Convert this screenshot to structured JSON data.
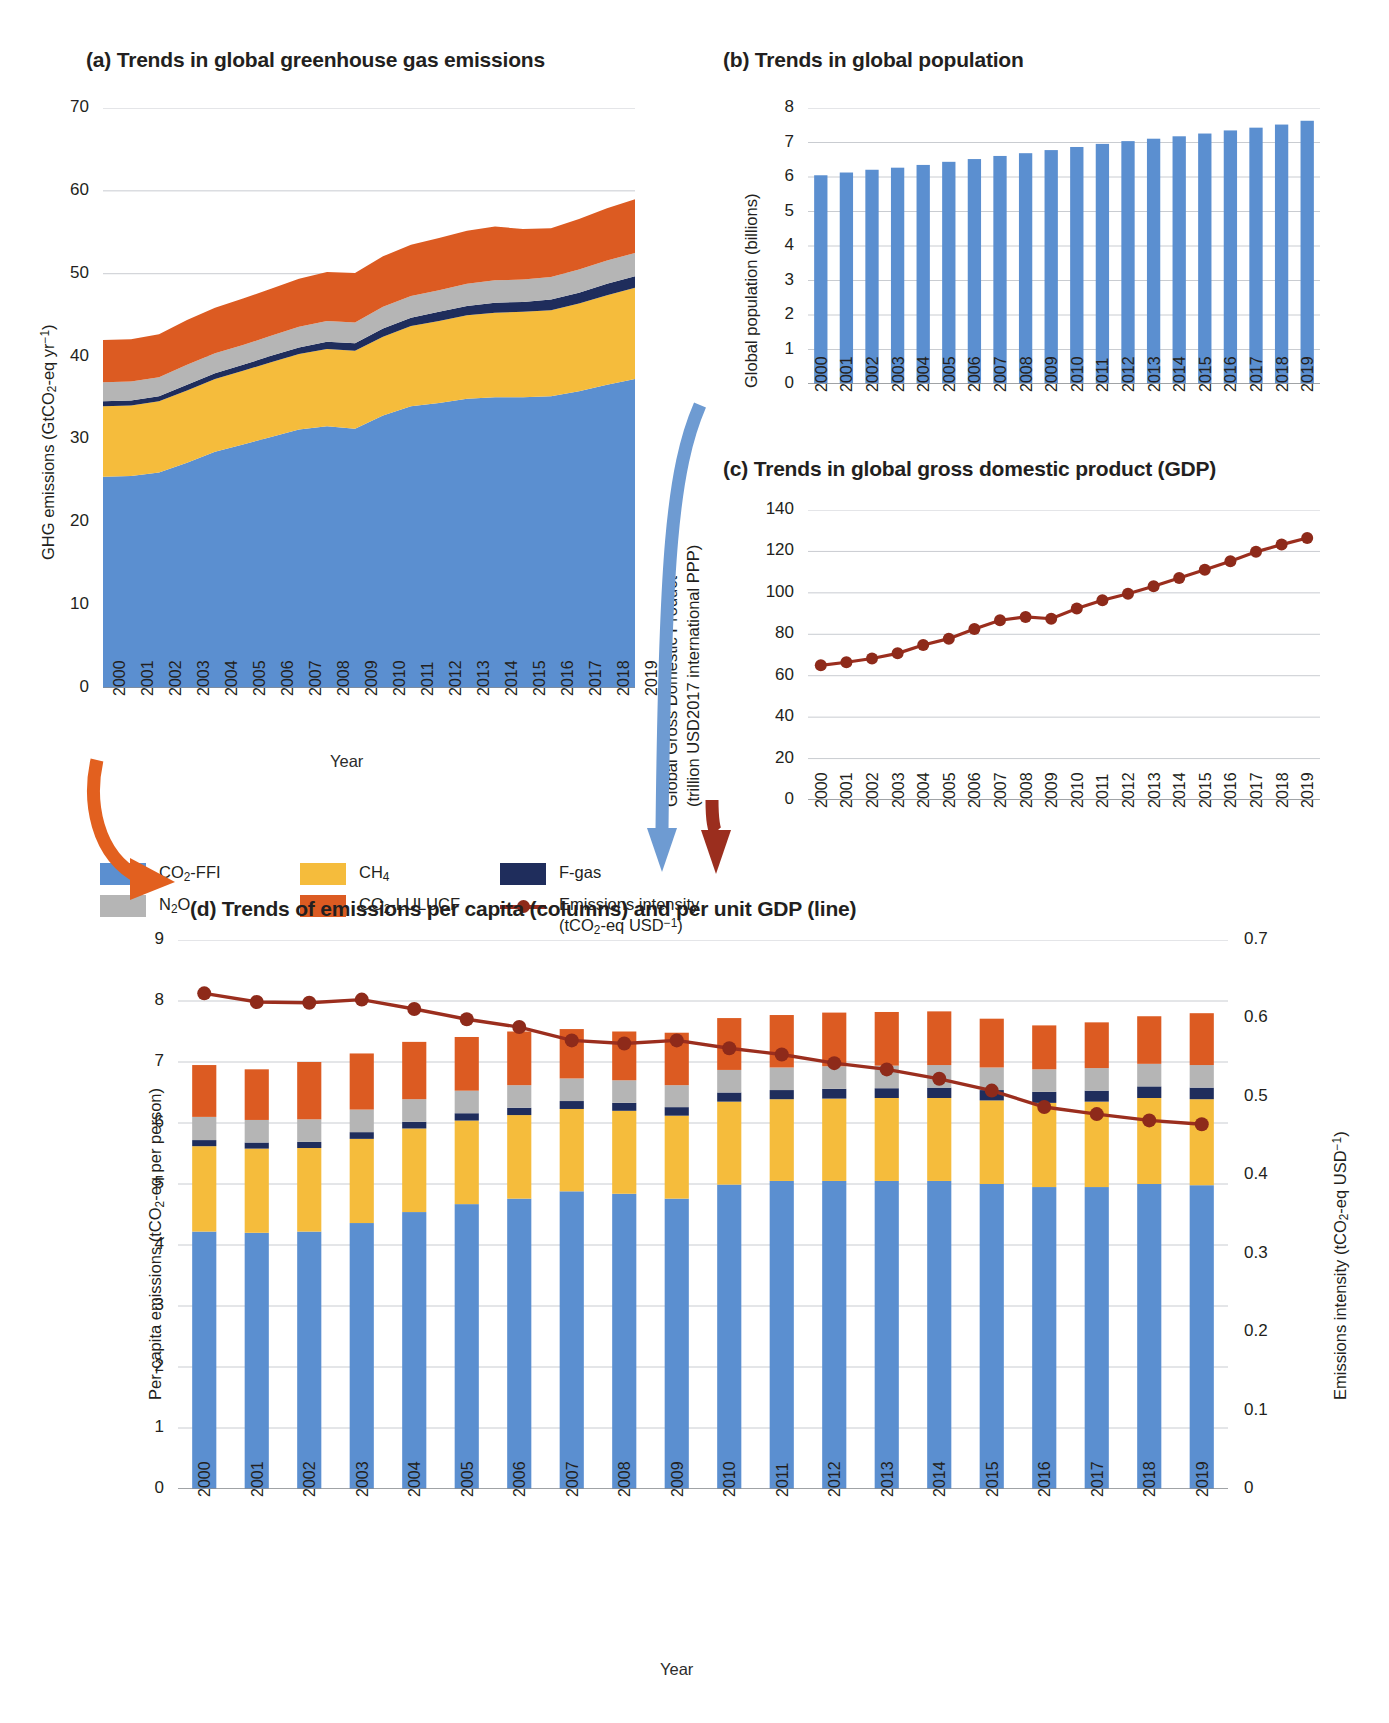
{
  "years": [
    "2000",
    "2001",
    "2002",
    "2003",
    "2004",
    "2005",
    "2006",
    "2007",
    "2008",
    "2009",
    "2010",
    "2011",
    "2012",
    "2013",
    "2014",
    "2015",
    "2016",
    "2017",
    "2018",
    "2019"
  ],
  "colors": {
    "co2_ffi": "#5b8fd0",
    "ch4": "#f5bc3c",
    "n2o": "#b5b5b5",
    "co2_lulucf": "#dc5b22",
    "fgas": "#1f2d5c",
    "intensity_line": "#9b2e1e",
    "grid": "#c9ccd1",
    "axis": "#8a8d91",
    "arrow_blue": "#6e9bd2",
    "arrow_red": "#9b2e1e",
    "arrow_orange": "#e2601f"
  },
  "legend": {
    "items": [
      {
        "name": "co2-ffi-legend",
        "label": "CO₂-FFI",
        "color": "#5b8fd0",
        "type": "swatch"
      },
      {
        "name": "ch4-legend",
        "label": "CH₄",
        "color": "#f5bc3c",
        "type": "swatch"
      },
      {
        "name": "fgas-legend",
        "label": "F-gas",
        "color": "#1f2d5c",
        "type": "swatch"
      },
      {
        "name": "n2o-legend",
        "label": "N₂O",
        "color": "#b5b5b5",
        "type": "swatch"
      },
      {
        "name": "co2-lulucf-legend",
        "label": "CO₂-LULUCF",
        "color": "#dc5b22",
        "type": "swatch"
      },
      {
        "name": "intensity-legend",
        "label": "Emissions intensity",
        "label2": "(tCO₂-eq USD⁻¹)",
        "color": "#9b2e1e",
        "type": "line"
      }
    ]
  },
  "panel_a": {
    "title": "(a) Trends in global greenhouse gas emissions",
    "ylabel": "GHG emissions (GtCO₂-eq yr⁻¹)",
    "xlabel": "Year",
    "yticks": [
      "0",
      "10",
      "20",
      "30",
      "40",
      "50",
      "60",
      "70"
    ],
    "chart_data": {
      "type": "area",
      "title": "(a) Trends in global greenhouse gas emissions",
      "xlabel": "Year",
      "ylabel": "GHG emissions (GtCO2-eq yr-1)",
      "ylim": [
        0,
        70
      ],
      "grid": true,
      "legend_position": "below",
      "x": [
        "2000",
        "2001",
        "2002",
        "2003",
        "2004",
        "2005",
        "2006",
        "2007",
        "2008",
        "2009",
        "2010",
        "2011",
        "2012",
        "2013",
        "2014",
        "2015",
        "2016",
        "2017",
        "2018",
        "2019"
      ],
      "stack_order": [
        "CO2-FFI",
        "CH4",
        "F-gas",
        "N2O",
        "CO2-LULUCF"
      ],
      "series": [
        {
          "name": "CO2-FFI",
          "color": "#5b8fd0",
          "values": [
            25.5,
            25.6,
            26.0,
            27.2,
            28.5,
            29.4,
            30.3,
            31.2,
            31.6,
            31.3,
            32.9,
            34.0,
            34.4,
            34.9,
            35.1,
            35.1,
            35.2,
            35.8,
            36.6,
            37.3
          ]
        },
        {
          "name": "CH4",
          "color": "#f5bc3c",
          "values": [
            8.5,
            8.5,
            8.6,
            8.7,
            8.8,
            8.9,
            9.0,
            9.1,
            9.3,
            9.4,
            9.5,
            9.7,
            9.9,
            10.1,
            10.2,
            10.3,
            10.4,
            10.6,
            10.8,
            11.0
          ]
        },
        {
          "name": "F-gas",
          "color": "#1f2d5c",
          "values": [
            0.6,
            0.6,
            0.6,
            0.7,
            0.7,
            0.7,
            0.8,
            0.8,
            0.9,
            0.9,
            1.0,
            1.0,
            1.1,
            1.1,
            1.2,
            1.2,
            1.3,
            1.3,
            1.4,
            1.4
          ]
        },
        {
          "name": "N2O",
          "color": "#b5b5b5",
          "values": [
            2.3,
            2.3,
            2.3,
            2.4,
            2.4,
            2.4,
            2.4,
            2.5,
            2.5,
            2.5,
            2.6,
            2.6,
            2.6,
            2.7,
            2.7,
            2.7,
            2.7,
            2.8,
            2.8,
            2.8
          ]
        },
        {
          "name": "CO2-LULUCF",
          "color": "#dc5b22",
          "values": [
            5.1,
            5.1,
            5.2,
            5.4,
            5.5,
            5.6,
            5.7,
            5.8,
            5.9,
            6.0,
            6.1,
            6.2,
            6.3,
            6.4,
            6.5,
            6.1,
            5.9,
            6.1,
            6.3,
            6.5
          ]
        }
      ],
      "totals": [
        42.0,
        42.1,
        42.7,
        44.4,
        45.9,
        47.0,
        48.2,
        49.4,
        50.2,
        50.1,
        52.1,
        53.5,
        54.3,
        55.2,
        55.7,
        55.4,
        55.5,
        56.6,
        57.9,
        59.0
      ]
    }
  },
  "panel_b": {
    "title": "(b) Trends in global population",
    "ylabel": "Global population (billions)",
    "yticks": [
      "0",
      "1",
      "2",
      "3",
      "4",
      "5",
      "6",
      "7",
      "8"
    ],
    "chart_data": {
      "type": "bar",
      "title": "(b) Trends in global population",
      "xlabel": "Year",
      "ylabel": "Global population (billions)",
      "ylim": [
        0,
        8
      ],
      "grid": true,
      "color": "#5b8fd0",
      "categories": [
        "2000",
        "2001",
        "2002",
        "2003",
        "2004",
        "2005",
        "2006",
        "2007",
        "2008",
        "2009",
        "2010",
        "2011",
        "2012",
        "2013",
        "2014",
        "2015",
        "2016",
        "2017",
        "2018",
        "2019"
      ],
      "values": [
        6.05,
        6.13,
        6.21,
        6.27,
        6.35,
        6.44,
        6.52,
        6.61,
        6.69,
        6.78,
        6.87,
        6.96,
        7.04,
        7.11,
        7.18,
        7.26,
        7.35,
        7.43,
        7.52,
        7.63
      ]
    }
  },
  "panel_c": {
    "title": "(c) Trends in global gross domestic product (GDP)",
    "ylabel_line1": "Global Gross Domestic Product",
    "ylabel_line2": "(trillion USD2017 international PPP)",
    "yticks": [
      "0",
      "20",
      "40",
      "60",
      "80",
      "100",
      "120",
      "140"
    ],
    "chart_data": {
      "type": "line",
      "title": "(c) Trends in global gross domestic product (GDP)",
      "xlabel": "Year",
      "ylabel": "Global Gross Domestic Product (trillion USD2017 international PPP)",
      "ylim": [
        0,
        140
      ],
      "grid": true,
      "color": "#9b2e1e",
      "marker": "circle",
      "x": [
        "2000",
        "2001",
        "2002",
        "2003",
        "2004",
        "2005",
        "2006",
        "2007",
        "2008",
        "2009",
        "2010",
        "2011",
        "2012",
        "2013",
        "2014",
        "2015",
        "2016",
        "2017",
        "2018",
        "2019"
      ],
      "values": [
        65.0,
        66.5,
        68.3,
        70.8,
        74.8,
        77.9,
        82.5,
        86.8,
        88.4,
        87.5,
        92.4,
        96.4,
        99.6,
        103.2,
        107.2,
        111.2,
        115.3,
        119.8,
        123.3,
        126.5
      ]
    }
  },
  "panel_d": {
    "title": "(d) Trends of emissions per capita (columns) and per unit GDP (line)",
    "ylabel_left": "Per-capita emissions (tCO₂-eq per person)",
    "ylabel_right": "Emissions intensity (tCO₂-eq USD⁻¹)",
    "xlabel": "Year",
    "yticks_left": [
      "0",
      "1",
      "2",
      "3",
      "4",
      "5",
      "6",
      "7",
      "8",
      "9"
    ],
    "yticks_right": [
      "0",
      "0.1",
      "0.2",
      "0.3",
      "0.4",
      "0.5",
      "0.6",
      "0.7"
    ],
    "chart_data": {
      "type": "bar",
      "title": "(d) Trends of emissions per capita (columns) and per unit GDP (line)",
      "xlabel": "Year",
      "ylabel": "Per-capita emissions (tCO2-eq per person)",
      "ylabel_secondary": "Emissions intensity (tCO2-eq USD-1)",
      "ylim": [
        0,
        9
      ],
      "ylim_secondary": [
        0,
        0.7
      ],
      "grid": true,
      "stacked": true,
      "categories": [
        "2000",
        "2001",
        "2002",
        "2003",
        "2004",
        "2005",
        "2006",
        "2007",
        "2008",
        "2009",
        "2010",
        "2011",
        "2012",
        "2013",
        "2014",
        "2015",
        "2016",
        "2017",
        "2018",
        "2019"
      ],
      "stack_order": [
        "CO2-FFI",
        "CH4",
        "F-gas",
        "N2O",
        "CO2-LULUCF"
      ],
      "series": [
        {
          "name": "CO2-FFI",
          "color": "#5b8fd0",
          "values": [
            4.22,
            4.2,
            4.22,
            4.36,
            4.54,
            4.67,
            4.76,
            4.88,
            4.84,
            4.76,
            4.99,
            5.05,
            5.05,
            5.05,
            5.05,
            5.0,
            4.95,
            4.95,
            5.0,
            4.98
          ]
        },
        {
          "name": "CH4",
          "color": "#f5bc3c",
          "values": [
            1.4,
            1.38,
            1.37,
            1.38,
            1.37,
            1.37,
            1.37,
            1.35,
            1.36,
            1.36,
            1.36,
            1.34,
            1.35,
            1.36,
            1.36,
            1.37,
            1.38,
            1.4,
            1.41,
            1.41
          ]
        },
        {
          "name": "F-gas",
          "color": "#1f2d5c",
          "values": [
            0.1,
            0.1,
            0.1,
            0.11,
            0.11,
            0.12,
            0.12,
            0.13,
            0.13,
            0.14,
            0.15,
            0.15,
            0.16,
            0.16,
            0.17,
            0.17,
            0.18,
            0.18,
            0.19,
            0.19
          ]
        },
        {
          "name": "N2O",
          "color": "#b5b5b5",
          "values": [
            0.38,
            0.37,
            0.37,
            0.37,
            0.37,
            0.37,
            0.37,
            0.37,
            0.37,
            0.36,
            0.37,
            0.37,
            0.37,
            0.37,
            0.37,
            0.37,
            0.37,
            0.37,
            0.37,
            0.37
          ]
        },
        {
          "name": "CO2-LULUCF",
          "color": "#dc5b22",
          "values": [
            0.85,
            0.83,
            0.94,
            0.92,
            0.94,
            0.88,
            0.88,
            0.81,
            0.8,
            0.86,
            0.85,
            0.86,
            0.88,
            0.88,
            0.88,
            0.8,
            0.72,
            0.75,
            0.78,
            0.85
          ]
        }
      ],
      "totals": [
        6.95,
        6.88,
        7.0,
        7.14,
        7.33,
        7.41,
        7.5,
        7.54,
        7.5,
        7.48,
        7.72,
        7.77,
        7.81,
        7.82,
        7.83,
        7.71,
        7.6,
        7.65,
        7.75,
        7.8
      ],
      "line_series": {
        "name": "Emissions intensity",
        "color": "#9b2e1e",
        "values": [
          0.632,
          0.621,
          0.62,
          0.624,
          0.612,
          0.599,
          0.589,
          0.572,
          0.568,
          0.572,
          0.562,
          0.554,
          0.543,
          0.535,
          0.523,
          0.508,
          0.487,
          0.478,
          0.47,
          0.465
        ]
      }
    }
  }
}
